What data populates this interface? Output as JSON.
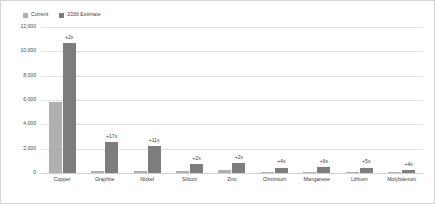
{
  "chart_data": {
    "type": "bar",
    "title": "",
    "subtitle": "",
    "xlabel": "",
    "ylabel": "",
    "ylim": [
      0,
      12000
    ],
    "yticks": [
      "0",
      "2,000",
      "4,000",
      "6,000",
      "8,000",
      "10,000",
      "12,000"
    ],
    "ytick_values": [
      0,
      2000,
      4000,
      6000,
      8000,
      10000,
      12000
    ],
    "grid": true,
    "legend_position": "top-left",
    "categories": [
      "Copper",
      "Graphite",
      "Nickel",
      "Silicon",
      "Zinc",
      "Chromium",
      "Manganese",
      "Lithium",
      "Molybdenum"
    ],
    "series": [
      {
        "name": "Current",
        "color": "#b0b0b0",
        "values": [
          5800,
          150,
          200,
          180,
          250,
          100,
          80,
          90,
          70
        ]
      },
      {
        "name": "2030 Estimate",
        "color": "#7d7d7d",
        "values": [
          10700,
          2550,
          2250,
          700,
          800,
          450,
          480,
          450,
          280
        ]
      }
    ],
    "annotations": [
      "+2x",
      "+17x",
      "+11x",
      "+2x",
      "+2x",
      "+4x",
      "+6x",
      "+5x",
      "+4x"
    ]
  },
  "legend": {
    "items": [
      {
        "label": "Current",
        "color": "#b0b0b0"
      },
      {
        "label": "2030 Estimate",
        "color": "#7d7d7d"
      }
    ]
  },
  "colors": {
    "current": "#b0b0b0",
    "estimate": "#7d7d7d",
    "gridline": "#e2e2e2",
    "border": "#d4d4d4",
    "text": "#3b3b3b"
  }
}
